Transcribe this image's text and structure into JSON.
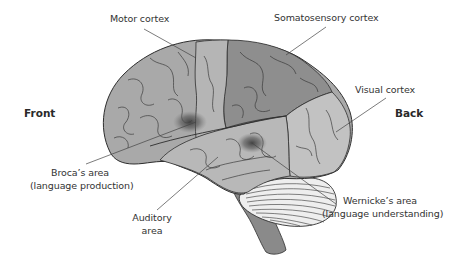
{
  "diagram": {
    "type": "labeled-illustration",
    "orientation": {
      "front_label": "Front",
      "back_label": "Back"
    },
    "labels": {
      "motor": "Motor cortex",
      "somatosensory": "Somatosensory cortex",
      "visual": "Visual cortex",
      "broca_line1": "Broca’s area",
      "broca_line2": "(language production)",
      "auditory_line1": "Auditory",
      "auditory_line2": "area",
      "wernicke_line1": "Wernicke’s area",
      "wernicke_line2": "(language understanding)"
    },
    "colors": {
      "frontal_lobe": "#a9a9a9",
      "motor_strip": "#b5b5b5",
      "somatosensory_parietal": "#8e8e8e",
      "temporal_lobe": "#b8b8b8",
      "occipital_lobe": "#c2c2c2",
      "cerebellum": "#eeeeee",
      "brainstem": "#8a8a8a",
      "outline": "#2e2e2e",
      "hotspot": "#555555",
      "leader_line": "#444444"
    }
  }
}
